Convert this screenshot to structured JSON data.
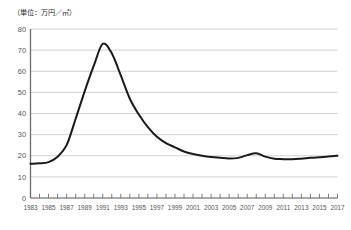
{
  "unit_note": "（単位：万円／㎡）",
  "colors": {
    "line": "#1a1a1a",
    "grid": "#c8c8c8",
    "axis": "#6e6e70",
    "tick_text": "#58585a",
    "note_text": "#2b2b2b",
    "background": "#ffffff"
  },
  "chart_data": {
    "type": "line",
    "title": "",
    "subtitle": "",
    "xlabel": "",
    "ylabel": "（単位：万円／㎡）",
    "ylim": [
      0,
      80
    ],
    "xlim": [
      1983,
      2017
    ],
    "ytick_step": 10,
    "grid": true,
    "grid_axis": "y",
    "legend": false,
    "legend_position": "none",
    "xtick_interval_years": 1,
    "xlabel_interval_years": 2,
    "ytick_labels": [
      "0",
      "10",
      "20",
      "30",
      "40",
      "50",
      "60",
      "70",
      "80"
    ],
    "ytick_values": [
      0,
      10,
      20,
      30,
      40,
      50,
      60,
      70,
      80
    ],
    "xtick_labels": [
      "1983",
      "1985",
      "1987",
      "1989",
      "1991",
      "1993",
      "1995",
      "1997",
      "1999",
      "2001",
      "2003",
      "2005",
      "2007",
      "2009",
      "2011",
      "2013",
      "2015",
      "2017"
    ],
    "x": [
      1983,
      1984,
      1985,
      1986,
      1987,
      1988,
      1989,
      1990,
      1991,
      1992,
      1993,
      1994,
      1995,
      1996,
      1997,
      1998,
      1999,
      2000,
      2001,
      2002,
      2003,
      2004,
      2005,
      2006,
      2007,
      2008,
      2009,
      2010,
      2011,
      2012,
      2013,
      2014,
      2015,
      2016,
      2017
    ],
    "values": [
      16.2,
      16.4,
      17.0,
      19.5,
      25.0,
      37.5,
      50.5,
      62.5,
      73.0,
      68.5,
      58.0,
      47.0,
      39.5,
      33.5,
      29.0,
      26.0,
      24.0,
      22.0,
      20.8,
      20.0,
      19.4,
      19.0,
      18.7,
      19.0,
      20.3,
      21.2,
      19.6,
      18.6,
      18.4,
      18.3,
      18.6,
      19.0,
      19.3,
      19.6,
      20.0
    ],
    "annotations": []
  }
}
